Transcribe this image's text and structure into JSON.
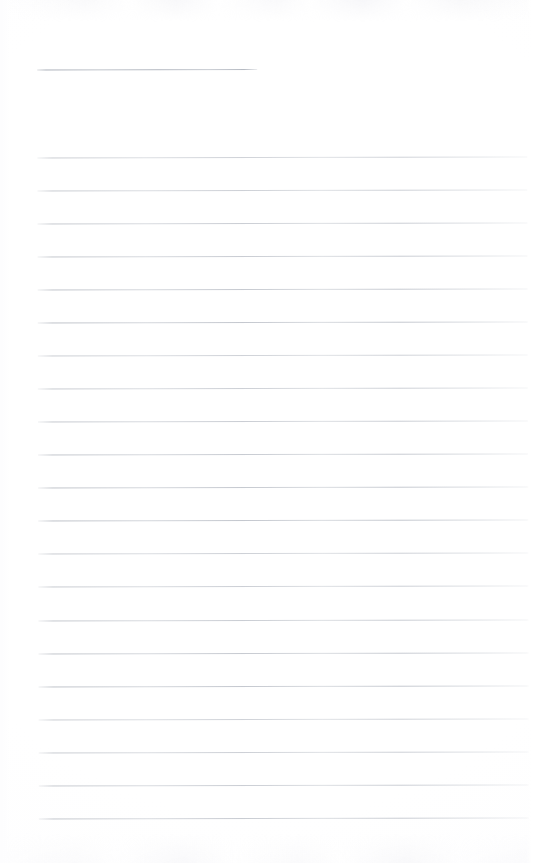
{
  "document": {
    "type": "scanned-blank-ruled-page",
    "title": "",
    "body_text": "",
    "page_width": 534,
    "page_height": 863,
    "background_color": "#ffffff",
    "rule_color": "#bcc0c7",
    "rule_opacity_note": "very light grey, scanned",
    "skew_degrees": -0.13
  },
  "header_rule": {
    "name": "title-rule",
    "label": "",
    "x": 38,
    "y": 69,
    "width": 220,
    "color": "#b0b5be"
  },
  "ruled_lines": {
    "count": 21,
    "left_x": 38,
    "right_x": 528,
    "first_y": 157,
    "spacing": 32.8,
    "color": "#bcc0c7",
    "y_positions": [
      157,
      190,
      223,
      256,
      289,
      322,
      355,
      388,
      421,
      454,
      487,
      520,
      553,
      586,
      620,
      653,
      686,
      719,
      752,
      785,
      818
    ]
  },
  "writing_areas": {
    "count": 21,
    "placeholder": "",
    "values": [
      "",
      "",
      "",
      "",
      "",
      "",
      "",
      "",
      "",
      "",
      "",
      "",
      "",
      "",
      "",
      "",
      "",
      "",
      "",
      "",
      ""
    ]
  },
  "scan_artifacts": {
    "top_noise_band": true,
    "bottom_noise_band": true,
    "right_edge_highlight": true,
    "left_edge_highlight": true
  }
}
